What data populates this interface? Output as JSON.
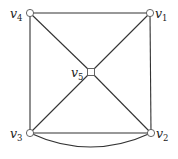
{
  "diagram": {
    "type": "graph",
    "vertices": [
      {
        "id": "v1",
        "base": "v",
        "sub": "1",
        "x": 150,
        "y": 13,
        "shape": "circle",
        "label_x": 155,
        "label_y": 18
      },
      {
        "id": "v2",
        "base": "v",
        "sub": "2",
        "x": 151,
        "y": 133,
        "shape": "circle",
        "label_x": 156,
        "label_y": 138
      },
      {
        "id": "v3",
        "base": "v",
        "sub": "3",
        "x": 30,
        "y": 133,
        "shape": "circle",
        "label_x": 10,
        "label_y": 138
      },
      {
        "id": "v4",
        "base": "v",
        "sub": "4",
        "x": 30,
        "y": 13,
        "shape": "circle",
        "label_x": 10,
        "label_y": 18
      },
      {
        "id": "v5",
        "base": "v",
        "sub": "5",
        "x": 91,
        "y": 72,
        "shape": "square",
        "label_x": 71,
        "label_y": 77
      }
    ],
    "edges": [
      {
        "from": "v4",
        "to": "v1",
        "kind": "straight"
      },
      {
        "from": "v1",
        "to": "v2",
        "kind": "straight"
      },
      {
        "from": "v2",
        "to": "v3",
        "kind": "straight"
      },
      {
        "from": "v3",
        "to": "v4",
        "kind": "straight"
      },
      {
        "from": "v4",
        "to": "v5",
        "kind": "straight"
      },
      {
        "from": "v5",
        "to": "v2",
        "kind": "straight"
      },
      {
        "from": "v1",
        "to": "v5",
        "kind": "straight"
      },
      {
        "from": "v5",
        "to": "v3",
        "kind": "straight"
      },
      {
        "from": "v3",
        "to": "v2",
        "kind": "curved",
        "control_y": 161
      }
    ]
  }
}
